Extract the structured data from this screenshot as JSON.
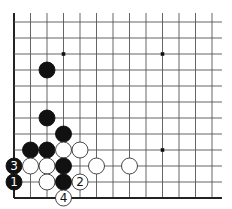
{
  "diagram": {
    "type": "go-board",
    "region": "lower-left corner",
    "grid": {
      "columns": 13,
      "rows": 12,
      "origin_x": 14,
      "origin_y": 22,
      "col_spacing": 16.5,
      "row_spacing": 16,
      "line_top": 13,
      "line_right": 222,
      "edges": [
        "left",
        "bottom"
      ]
    },
    "colors": {
      "line": "#555555",
      "edge": "#222222",
      "black_stone": "#111111",
      "white_stone": "#ffffff",
      "white_stone_stroke": "#333333",
      "background": "#ffffff"
    },
    "star_points": [
      {
        "col": 3,
        "row": 2
      },
      {
        "col": 9,
        "row": 2
      },
      {
        "col": 9,
        "row": 8
      }
    ],
    "stones": [
      {
        "color": "black",
        "col": 2,
        "row": 3,
        "label": ""
      },
      {
        "color": "black",
        "col": 2,
        "row": 6,
        "label": ""
      },
      {
        "color": "black",
        "col": 3,
        "row": 7,
        "label": ""
      },
      {
        "color": "black",
        "col": 1,
        "row": 8,
        "label": ""
      },
      {
        "color": "black",
        "col": 2,
        "row": 8,
        "label": ""
      },
      {
        "color": "white",
        "col": 3,
        "row": 8,
        "label": ""
      },
      {
        "color": "white",
        "col": 4,
        "row": 8,
        "label": ""
      },
      {
        "color": "black",
        "col": 0,
        "row": 9,
        "label": "3"
      },
      {
        "color": "white",
        "col": 1,
        "row": 9,
        "label": ""
      },
      {
        "color": "white",
        "col": 2,
        "row": 9,
        "label": ""
      },
      {
        "color": "black",
        "col": 3,
        "row": 9,
        "label": ""
      },
      {
        "color": "white",
        "col": 5,
        "row": 9,
        "label": ""
      },
      {
        "color": "white",
        "col": 7,
        "row": 9,
        "label": ""
      },
      {
        "color": "black",
        "col": 0,
        "row": 10,
        "label": "1"
      },
      {
        "color": "white",
        "col": 2,
        "row": 10,
        "label": ""
      },
      {
        "color": "black",
        "col": 3,
        "row": 10,
        "label": ""
      },
      {
        "color": "white",
        "col": 4,
        "row": 10,
        "label": "2"
      },
      {
        "color": "white",
        "col": 3,
        "row": 11,
        "label": "4"
      }
    ],
    "move_labels": [
      "1",
      "2",
      "3",
      "4"
    ]
  }
}
